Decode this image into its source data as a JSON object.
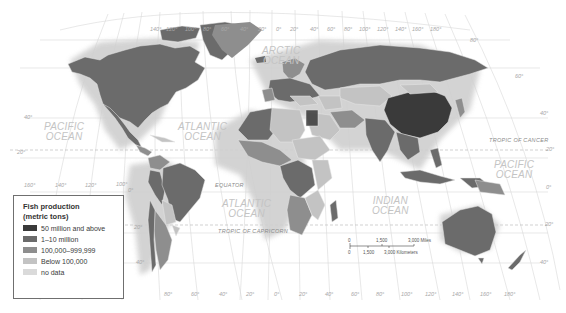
{
  "map": {
    "title": "Fish production world map",
    "colors": {
      "ocean": "#ffffff",
      "graticule": "#d6d6d6",
      "class_1": "#3a3a3a",
      "class_2": "#6b6b6b",
      "class_3": "#8e8e8e",
      "class_4": "#c3c3c3",
      "class_5": "#dadada"
    },
    "ocean_labels": [
      {
        "name": "pacific_ocean_west",
        "line1": "PACIFIC",
        "line2": "OCEAN"
      },
      {
        "name": "atlantic_ocean_north",
        "line1": "ATLANTIC",
        "line2": "OCEAN"
      },
      {
        "name": "arctic_ocean",
        "line1": "ARCTIC",
        "line2": "OCEAN"
      },
      {
        "name": "atlantic_ocean_south",
        "line1": "ATLANTIC",
        "line2": "OCEAN"
      },
      {
        "name": "indian_ocean",
        "line1": "INDIAN",
        "line2": "OCEAN"
      },
      {
        "name": "pacific_ocean_east",
        "line1": "PACIFIC",
        "line2": "OCEAN"
      }
    ],
    "line_labels": {
      "tropic_of_cancer": "TROPIC OF CANCER",
      "equator": "EQUATOR",
      "tropic_of_capricorn": "TROPIC OF CAPRICORN"
    },
    "top_longitudes": [
      "140°",
      "120°",
      "100°",
      "80°",
      "60°",
      "40°",
      "20°",
      "0°",
      "20°",
      "40°",
      "60°",
      "80°",
      "100°",
      "120°",
      "140°",
      "160°",
      "180°"
    ],
    "bottom_longitudes": [
      "80°",
      "60°",
      "40°",
      "20°",
      "0°",
      "20°",
      "40°",
      "60°",
      "80°",
      "100°",
      "120°",
      "140°",
      "160°",
      "180°"
    ],
    "left_longitudes": [
      "160°",
      "140°",
      "120°",
      "100°"
    ],
    "latitudes": {
      "left_40": "40°",
      "left_20": "20°",
      "left_0": "0°",
      "left_s20": "20°",
      "left_s40": "40°",
      "right_60": "60°",
      "right_40": "40°",
      "right_20": "20°",
      "right_0": "0°",
      "right_s20": "20°",
      "right_s40": "40°",
      "right_80": "80°"
    }
  },
  "legend": {
    "title_line1": "Fish production",
    "title_line2": "(metric tons)",
    "items": [
      {
        "label": "50 million and above",
        "color": "#3a3a3a"
      },
      {
        "label": "1–10 million",
        "color": "#6b6b6b"
      },
      {
        "label": "100,000–999,999",
        "color": "#8e8e8e"
      },
      {
        "label": "Below 100,000",
        "color": "#c3c3c3"
      },
      {
        "label": "no data",
        "color": "#dadada"
      }
    ]
  },
  "scale_bar": {
    "miles_ticks": [
      "0",
      "1,500",
      "3,000 Miles"
    ],
    "km_ticks": [
      "0",
      "1,500",
      "3,000 Kilometers"
    ]
  }
}
